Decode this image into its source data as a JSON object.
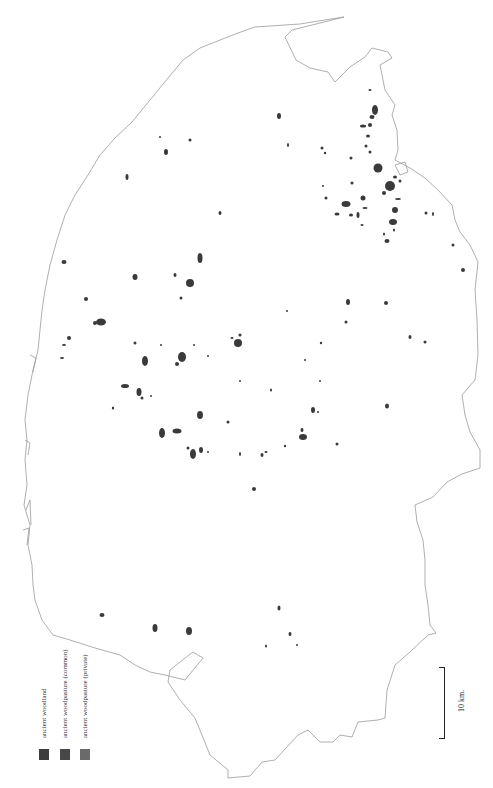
{
  "map": {
    "type": "distribution map",
    "scale_bar": {
      "label": "10 km."
    },
    "legend": {
      "items": [
        {
          "label": "ancient woodland",
          "color": "#3c3c3c"
        },
        {
          "label": "ancient woodpasture (common)",
          "color": "#484848"
        },
        {
          "label": "ancient woodpasture (private)",
          "color": "#6a6a6a"
        }
      ]
    },
    "colors": {
      "coastline": "#9a9a9a",
      "patch": "#3a3a3a",
      "background": "#ffffff"
    }
  }
}
